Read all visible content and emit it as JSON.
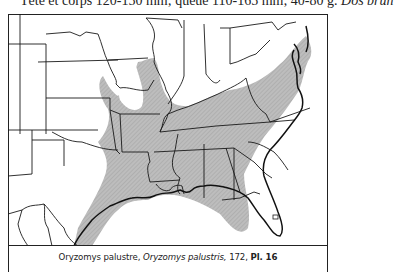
{
  "header": {
    "text_lead": "Tête et corps 120-150 mm; queue 110-165 mm; 40-80 g.",
    "text_italic": "Dos brun"
  },
  "map": {
    "subject": "range-map",
    "species": "Oryzomys palustris",
    "range_fill_color": "#b8b8b8",
    "border_color": "#1a1a1a",
    "range_region": "southeastern United States: Texas Gulf coast and eastern Texas, Oklahoma east edge, Kansas southeast, Missouri south, Illinois south, Kentucky, Tennessee, Arkansas, Louisiana, Mississippi, Alabama, Georgia, Florida, South Carolina, North Carolina, Virginia, Maryland, Delaware, southern New Jersey"
  },
  "caption": {
    "common_name": "Oryzomys palustre,",
    "scientific_name": "Oryzomys palustris,",
    "page": "172,",
    "plate": "Pl. 16"
  }
}
